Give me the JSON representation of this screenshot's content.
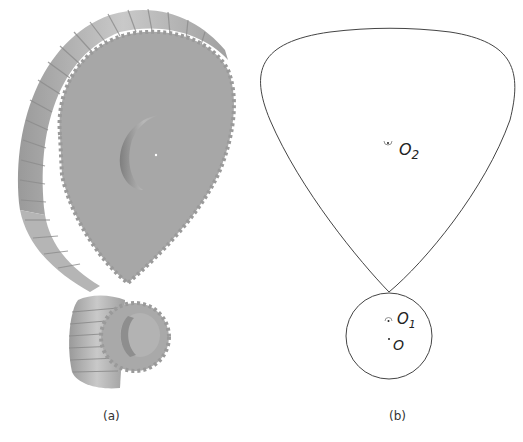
{
  "figure": {
    "panels": [
      {
        "id": "a",
        "caption": "(a)",
        "description": "3D render of a helical non-circular (Reuleaux-like) gear meshing with a small cylindrical helical pinion",
        "colors": {
          "face": "#a9a9a9",
          "teeth_light": "#c8c8c8",
          "teeth_dark": "#8a8a8a"
        }
      },
      {
        "id": "b",
        "caption": "(b)",
        "description": "2D pitch curves: rounded-triangle pitch curve with center O2 tangent to small circle with center O1; point O offset below O1",
        "labels": {
          "o2": "O",
          "o2_sub": "2",
          "o1": "O",
          "o1_sub": "1",
          "o": "O"
        },
        "colors": {
          "stroke": "#444444"
        }
      }
    ]
  }
}
